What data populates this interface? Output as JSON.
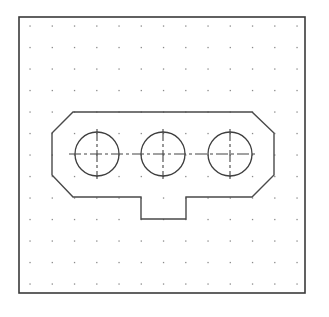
{
  "drawing": {
    "title": "Plate with three holes and tab",
    "frame": {
      "x": 19,
      "y": 17,
      "width": 286,
      "height": 276
    },
    "grid": {
      "x0": 30,
      "y0": 26,
      "dx": 22.25,
      "dy": 21.5,
      "cols": 13,
      "rows": 13
    },
    "outline_points": [
      [
        73,
        112
      ],
      [
        252,
        112
      ],
      [
        274,
        133
      ],
      [
        274,
        175
      ],
      [
        252,
        197
      ],
      [
        186,
        197
      ],
      [
        186,
        219
      ],
      [
        141,
        219
      ],
      [
        141,
        197
      ],
      [
        73,
        197
      ],
      [
        52,
        175
      ],
      [
        52,
        133
      ]
    ],
    "holes": [
      {
        "cx": 97,
        "cy": 154,
        "r": 22
      },
      {
        "cx": 163,
        "cy": 154,
        "r": 22
      },
      {
        "cx": 230,
        "cy": 154,
        "r": 22
      }
    ],
    "centerline_horizontal": {
      "x1": 69,
      "x2": 256,
      "y": 154
    },
    "centerline_vertical_extent": 25,
    "colors": {
      "frame": "#3a3a3a",
      "outline": "#4a4a4a",
      "grid_dot": "#8a8a8a",
      "background": "#ffffff"
    }
  }
}
